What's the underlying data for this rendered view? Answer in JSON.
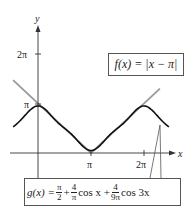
{
  "chart_data": {
    "type": "line",
    "title": "",
    "xlabel": "x",
    "ylabel": "y",
    "x_ticks": [
      "π",
      "2π"
    ],
    "y_ticks": [
      "π",
      "2π"
    ],
    "xlim": [
      -0.47,
      2.5
    ],
    "ylim": [
      -0.5,
      2.5
    ],
    "units": "multiples of π",
    "series": [
      {
        "name": "f(x) = |x − π|",
        "color": "#9a9a9a",
        "type": "absolute-value",
        "points_x_over_pi": [
          -0.47,
          1.0,
          2.3
        ],
        "points_y_over_pi": [
          1.47,
          0.0,
          1.3
        ]
      },
      {
        "name": "g(x) = π/2 + (4/π) cos x + (4/(9π)) cos 3x",
        "color": "#111111",
        "type": "fourier-approximation",
        "x_over_pi": [
          -0.47,
          -0.25,
          0,
          0.25,
          0.5,
          0.75,
          1.0,
          1.25,
          1.5,
          1.75,
          2.0,
          2.25,
          2.47
        ],
        "y_over_pi": [
          0.59,
          0.8,
          0.94,
          0.77,
          0.5,
          0.23,
          0.06,
          0.23,
          0.5,
          0.77,
          0.94,
          0.8,
          0.59
        ]
      }
    ],
    "annotations": [
      {
        "target": "f",
        "text": "f(x) = |x − π|"
      },
      {
        "target": "g",
        "text": "g(x) = π/2 + 4/π cos x + 4/9π cos 3x"
      }
    ],
    "grid": false,
    "legend_position": "callout-boxes"
  },
  "axes": {
    "x_label": "x",
    "y_label": "y",
    "x_tick_pi": "π",
    "x_tick_2pi": "2π",
    "y_tick_pi": "π",
    "y_tick_2pi": "2π"
  },
  "labels": {
    "f_lhs": "f(x) = |x − π|",
    "g_lhs": "g(x) = ",
    "g_frac1_num": "π",
    "g_frac1_den": "2",
    "g_plus1": " + ",
    "g_frac2_num": "4",
    "g_frac2_den": "π",
    "g_cos1": " cos x + ",
    "g_frac3_num": "4",
    "g_frac3_den": "9π",
    "g_cos3": " cos 3x"
  }
}
